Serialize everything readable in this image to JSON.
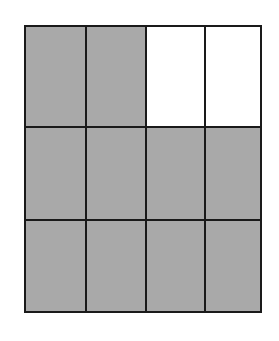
{
  "diagram": {
    "type": "fraction-grid",
    "columns": 4,
    "rows": 3,
    "total_cells": 12,
    "shaded_count": 10,
    "colors": {
      "shaded": "#a9a9a9",
      "unshaded": "#ffffff",
      "border": "#1a1a1a"
    },
    "cells": [
      [
        true,
        true,
        false,
        false
      ],
      [
        true,
        true,
        true,
        true
      ],
      [
        true,
        true,
        true,
        true
      ]
    ]
  }
}
